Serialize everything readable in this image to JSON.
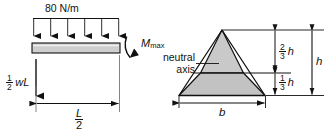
{
  "figure": {
    "colors": {
      "line": "#111111",
      "beam_fill": "#cfcfcf",
      "triangle_upper_fill": "#c9c9c9",
      "triangle_lower_fill": "#c2c2c2",
      "background": "#ffffff"
    }
  },
  "beam_diagram": {
    "distributed_load_label": "80 N/m",
    "arrow_count": 6,
    "moment_label": {
      "base": "M",
      "subscript": "max"
    },
    "reaction_label": {
      "fraction_numerator": "1",
      "fraction_denominator": "2",
      "variable": "wL"
    },
    "span_label": {
      "fraction_numerator": "L",
      "fraction_denominator": "2"
    }
  },
  "cross_section": {
    "neutral_axis_label_line1": "neutral",
    "neutral_axis_label_line2": "axis",
    "base_label": "b",
    "height_label": "h",
    "upper_distance": {
      "fraction_numerator": "2",
      "fraction_denominator": "3",
      "variable": "h"
    },
    "lower_distance": {
      "fraction_numerator": "1",
      "fraction_denominator": "3",
      "variable": "h"
    }
  }
}
